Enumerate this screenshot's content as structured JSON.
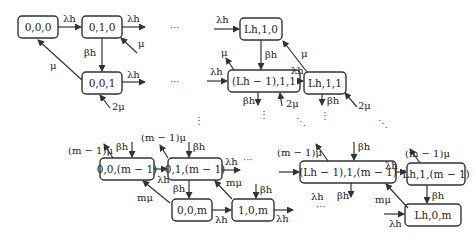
{
  "diagram": {
    "title": "",
    "nodes": [
      {
        "id": "n000",
        "label": "0,0,0"
      },
      {
        "id": "n010",
        "label": "0,1,0"
      },
      {
        "id": "n001",
        "label": "0,0,1"
      },
      {
        "id": "nL10",
        "label": "Lh,1,0"
      },
      {
        "id": "nLm111",
        "label": "(Lh − 1),1,1"
      },
      {
        "id": "nL11",
        "label": "Lh,1,1"
      },
      {
        "id": "n00m1",
        "label": "0,0,(m − 1)"
      },
      {
        "id": "n01m1",
        "label": "0,1,(m − 1)"
      },
      {
        "id": "n00m",
        "label": "0,0,m"
      },
      {
        "id": "n10m",
        "label": "1,0,m"
      },
      {
        "id": "nLm11m1",
        "label": "(Lh − 1),1,(m − 1)"
      },
      {
        "id": "nL1m1",
        "label": "Lh,1,(m − 1)"
      },
      {
        "id": "nL0m",
        "label": "Lh,0,m"
      }
    ],
    "edge_labels": {
      "lambda": "λh",
      "beta": "βh",
      "mu": "μ",
      "two_mu": "2μ",
      "m_minus_1_mu": "(m − 1)μ",
      "m_mu": "mμ",
      "ellipsis_h": "···",
      "ellipsis_v": "⋮",
      "ellipsis_d": "⋱"
    }
  }
}
